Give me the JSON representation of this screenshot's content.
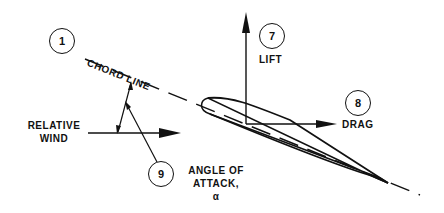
{
  "diagram": {
    "callouts": [
      {
        "number": "1",
        "label": "CHORD LINE"
      },
      {
        "number": "7",
        "label": "LIFT"
      },
      {
        "number": "8",
        "label": "DRAG"
      },
      {
        "number": "9",
        "label_line1": "ANGLE OF",
        "label_line2": "ATTACK,",
        "label_line3": "α"
      }
    ],
    "relative_wind": {
      "line1": "RELATIVE",
      "line2": "WIND"
    },
    "colors": {
      "ink": "#111111",
      "background": "#ffffff"
    }
  }
}
